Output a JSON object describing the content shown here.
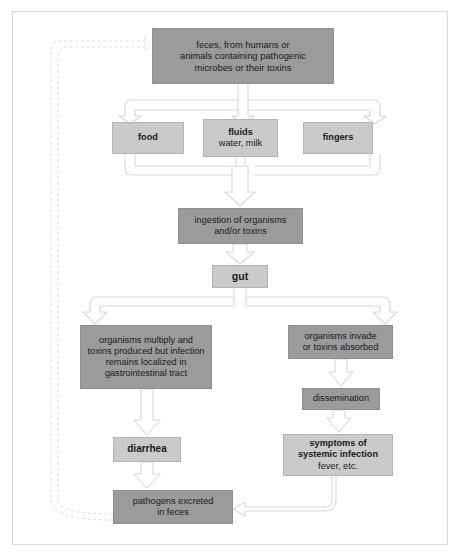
{
  "diagram": {
    "colors": {
      "fill_dark": "#9b9b9b",
      "fill_light": "#cacaca",
      "arrow_outline": "#d6d6d6",
      "frame": "#d9d9d9",
      "text": "#1a1a1a"
    },
    "nodes": {
      "feces": {
        "line1": "feces, from humans or",
        "line2": "animals containing pathogenic",
        "line3": "microbes or their toxins"
      },
      "food": {
        "line1": "food"
      },
      "fluids": {
        "line1": "fluids",
        "line2": "water, milk"
      },
      "fingers": {
        "line1": "fingers"
      },
      "ingestion": {
        "line1": "ingestion of organisms",
        "line2": "and/or toxins"
      },
      "gut": {
        "line1": "gut"
      },
      "localized": {
        "line1": "organisms multiply and",
        "line2": "toxins produced but infection",
        "line3": "remains localized in",
        "line4": "gastrointestinal tract"
      },
      "invade": {
        "line1": "organisms invade",
        "line2": "or toxins absorbed"
      },
      "dissemination": {
        "line1": "dissemination"
      },
      "diarrhea": {
        "line1": "diarrhea"
      },
      "symptoms": {
        "line1": "symptoms of",
        "line2": "systemic infection",
        "line3": "fever, etc."
      },
      "excreted": {
        "line1": "pathogens excreted",
        "line2": "in feces"
      }
    },
    "edges": [
      {
        "from": "feces",
        "to": "food",
        "style": "solid-hollow"
      },
      {
        "from": "feces",
        "to": "fluids",
        "style": "solid-hollow"
      },
      {
        "from": "feces",
        "to": "fingers",
        "style": "solid-hollow"
      },
      {
        "from": "food",
        "to": "ingestion",
        "style": "solid-hollow"
      },
      {
        "from": "fluids",
        "to": "ingestion",
        "style": "solid-hollow"
      },
      {
        "from": "fingers",
        "to": "ingestion",
        "style": "solid-hollow"
      },
      {
        "from": "ingestion",
        "to": "gut",
        "style": "solid-hollow"
      },
      {
        "from": "gut",
        "to": "localized",
        "style": "solid-hollow"
      },
      {
        "from": "gut",
        "to": "invade",
        "style": "solid-hollow"
      },
      {
        "from": "localized",
        "to": "diarrhea",
        "style": "solid-hollow"
      },
      {
        "from": "invade",
        "to": "dissemination",
        "style": "solid-hollow"
      },
      {
        "from": "dissemination",
        "to": "symptoms",
        "style": "solid-hollow"
      },
      {
        "from": "diarrhea",
        "to": "excreted",
        "style": "solid-hollow"
      },
      {
        "from": "symptoms",
        "to": "excreted",
        "style": "solid-hollow-elbow"
      },
      {
        "from": "excreted",
        "to": "feces",
        "style": "dashed-hollow-loop"
      }
    ]
  }
}
